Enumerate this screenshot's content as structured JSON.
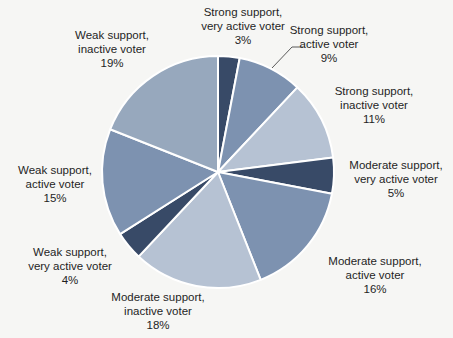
{
  "chart_data": {
    "type": "pie",
    "title": "",
    "legend_position": "none",
    "label_style": "outside, category name and percentage",
    "background_color": "#f6f6f4",
    "divider_color": "#ffffff",
    "categories": [
      "Strong support, very active voter",
      "Strong support, active voter",
      "Strong support, inactive voter",
      "Moderate support, very active voter",
      "Moderate support, active voter",
      "Moderate support, inactive voter",
      "Weak support, very active voter",
      "Weak support, active voter",
      "Weak support, inactive voter"
    ],
    "values": [
      3,
      9,
      11,
      5,
      16,
      18,
      4,
      15,
      19
    ],
    "slices": [
      {
        "group": "Strong support,",
        "activity": "very active voter",
        "pct_label": "3%",
        "value": 3,
        "color": "#384a67"
      },
      {
        "group": "Strong support,",
        "activity": "active voter",
        "pct_label": "9%",
        "value": 9,
        "color": "#7d92b0"
      },
      {
        "group": "Strong support,",
        "activity": "inactive voter",
        "pct_label": "11%",
        "value": 11,
        "color": "#b6c2d3"
      },
      {
        "group": "Moderate support,",
        "activity": "very active voter",
        "pct_label": "5%",
        "value": 5,
        "color": "#384a67"
      },
      {
        "group": "Moderate support,",
        "activity": "active voter",
        "pct_label": "16%",
        "value": 16,
        "color": "#7d92b0"
      },
      {
        "group": "Moderate support,",
        "activity": "inactive voter",
        "pct_label": "18%",
        "value": 18,
        "color": "#b6c2d3"
      },
      {
        "group": "Weak support,",
        "activity": "very active voter",
        "pct_label": "4%",
        "value": 4,
        "color": "#384a67"
      },
      {
        "group": "Weak support,",
        "activity": "active voter",
        "pct_label": "15%",
        "value": 15,
        "color": "#7d92b0"
      },
      {
        "group": "Weak support,",
        "activity": "inactive voter",
        "pct_label": "19%",
        "value": 19,
        "color": "#97a8bd"
      }
    ],
    "leader_line": {
      "attached_to": "Strong support, active voter",
      "color": "#595959"
    }
  }
}
